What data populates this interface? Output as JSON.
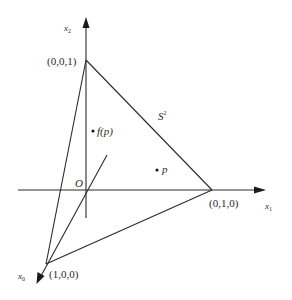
{
  "diagram": {
    "axes": {
      "x0": {
        "label": "x",
        "subscript": "0"
      },
      "x1": {
        "label": "x",
        "subscript": "1"
      },
      "x2": {
        "label": "x",
        "subscript": "2"
      }
    },
    "origin_label": "O",
    "vertices": {
      "v001": "(0,0,1)",
      "v010": "(0,1,0)",
      "v100": "(1,0,0)"
    },
    "simplex_label": {
      "base": "S",
      "superscript": "2"
    },
    "points": {
      "fp": "f(p)",
      "p": "p"
    },
    "colors": {
      "line": "#2a2a2a",
      "background": "#ffffff"
    }
  }
}
